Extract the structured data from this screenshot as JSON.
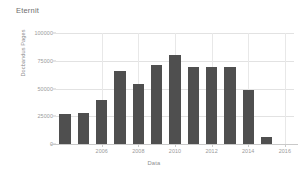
{
  "chart_data": {
    "type": "bar",
    "title": "Eternit",
    "xlabel": "Data",
    "ylabel": "Docbandus Pages",
    "categories": [
      2004,
      2005,
      2006,
      2007,
      2008,
      2009,
      2010,
      2011,
      2012,
      2013,
      2014,
      2015,
      2016
    ],
    "values": [
      27000,
      27500,
      39500,
      65500,
      54500,
      71000,
      80000,
      69500,
      69000,
      69000,
      48500,
      6500,
      0
    ],
    "bars": [
      {
        "label": "2004",
        "value": 27000
      },
      {
        "label": "2005",
        "value": 27500
      },
      {
        "label": "2006",
        "value": 39500
      },
      {
        "label": "2007",
        "value": 65500
      },
      {
        "label": "2008",
        "value": 54500
      },
      {
        "label": "2009",
        "value": 71000
      },
      {
        "label": "2010",
        "value": 80000
      },
      {
        "label": "2011",
        "value": 69500
      },
      {
        "label": "2012",
        "value": 69000
      },
      {
        "label": "2013",
        "value": 69000
      },
      {
        "label": "2014",
        "value": 48500
      },
      {
        "label": "2015",
        "value": 6500
      },
      {
        "label": "2016",
        "value": 0
      }
    ],
    "xtick_labels": [
      "2006",
      "2008",
      "2010",
      "2012",
      "2014",
      "2016"
    ],
    "ytick_labels": [
      "0",
      "25000",
      "50000",
      "75000",
      "100000"
    ],
    "ytick_values": [
      0,
      25000,
      50000,
      75000,
      100000
    ],
    "ylim": [
      0,
      100000
    ],
    "grid": true,
    "legend": false,
    "bar_color": "#4f4f4f",
    "grid_color": "#e2e2e2",
    "background": "#ffffff"
  }
}
